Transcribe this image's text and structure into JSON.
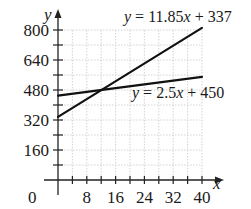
{
  "chart_data": {
    "type": "line",
    "title": "",
    "xlabel": "x",
    "ylabel": "y",
    "xlim": [
      0,
      40
    ],
    "ylim": [
      0,
      800
    ],
    "x_ticks": [
      0,
      8,
      16,
      24,
      32,
      40
    ],
    "x_minor_step": 4,
    "y_ticks": [
      160,
      320,
      480,
      640,
      800
    ],
    "y_minor_step": 80,
    "grid": true,
    "series": [
      {
        "name": "y = 11.85x + 337",
        "slope": 11.85,
        "intercept": 337,
        "x": [
          0,
          40
        ],
        "values": [
          337,
          811
        ]
      },
      {
        "name": "y = 2.5x + 450",
        "slope": 2.5,
        "intercept": 450,
        "x": [
          0,
          40
        ],
        "values": [
          450,
          550
        ]
      }
    ],
    "annotations": [
      {
        "text": "y = 11.85x + 337",
        "near": "upper line end"
      },
      {
        "text": "y = 2.5x + 450",
        "near": "below lower line"
      }
    ],
    "intersection": {
      "x": 12.1,
      "y": 480
    }
  },
  "labels": {
    "x_axis": "x",
    "y_axis": "y",
    "origin": "0",
    "eq1_lhs": "y",
    "eq1_rhs": " = 11.85",
    "eq1_var": "x",
    "eq1_tail": " + 337",
    "eq2_lhs": "y",
    "eq2_rhs": " = 2.5",
    "eq2_var": "x",
    "eq2_tail": " + 450"
  },
  "colors": {
    "line": "#111111",
    "grid": "#c8c8c8",
    "axis": "#222222"
  }
}
